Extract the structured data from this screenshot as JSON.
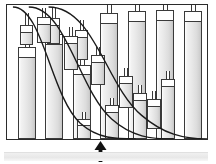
{
  "figure": {
    "frame": {
      "x": 6,
      "y": 4,
      "width": 202,
      "height": 136,
      "border_color": "#2b2b2b"
    },
    "colors": {
      "outline": "#3a3a3a",
      "frame_border": "#2b2b2b",
      "curve": "#1a1a1a",
      "arrow": "#111111",
      "cylinder_light": "#ffffff",
      "cylinder_dark": "#c4c4c4",
      "cap_fill": "#ffffff",
      "bottom_band": "#ececec"
    },
    "cylinders": [
      {
        "name": "cyl-r1c1",
        "x": 11,
        "y": 42,
        "w": 18,
        "h": 92,
        "cap_h": 11,
        "stem_h": 20,
        "stem_w": 5
      },
      {
        "name": "cyl-r1c2",
        "x": 38,
        "y": 29,
        "w": 18,
        "h": 105,
        "cap_h": 11,
        "stem_h": 16,
        "stem_w": 5
      },
      {
        "name": "cyl-r1c3",
        "x": 66,
        "y": 60,
        "w": 18,
        "h": 74,
        "cap_h": 10,
        "stem_h": 14,
        "stem_w": 5
      },
      {
        "name": "cyl-r1c4",
        "x": 93,
        "y": 8,
        "w": 18,
        "h": 126,
        "cap_h": 11,
        "stem_h": 8,
        "stem_w": 5
      },
      {
        "name": "cyl-r1c5",
        "x": 121,
        "y": 6,
        "w": 18,
        "h": 128,
        "cap_h": 11,
        "stem_h": 6,
        "stem_w": 5
      },
      {
        "name": "cyl-r1c6",
        "x": 149,
        "y": 5,
        "w": 18,
        "h": 129,
        "cap_h": 11,
        "stem_h": 5,
        "stem_w": 5
      },
      {
        "name": "cyl-r1c7",
        "x": 177,
        "y": 6,
        "w": 18,
        "h": 128,
        "cap_h": 11,
        "stem_h": 6,
        "stem_w": 5
      },
      {
        "name": "cyl-r2c1",
        "x": 13,
        "y": 20,
        "w": 13,
        "h": 20,
        "cap_h": 8,
        "stem_h": 12,
        "stem_w": 4
      },
      {
        "name": "cyl-r2c2",
        "x": 40,
        "y": 13,
        "w": 13,
        "h": 26,
        "cap_h": 8,
        "stem_h": 10,
        "stem_w": 4
      },
      {
        "name": "cyl-r2c3",
        "x": 68,
        "y": 25,
        "w": 13,
        "h": 30,
        "cap_h": 8,
        "stem_h": 10,
        "stem_w": 4
      },
      {
        "name": "cyl-small-a",
        "x": 30,
        "y": 12,
        "w": 14,
        "h": 26,
        "cap_h": 8,
        "stem_h": 9,
        "stem_w": 4
      },
      {
        "name": "cyl-mid-a",
        "x": 57,
        "y": 31,
        "w": 14,
        "h": 34,
        "cap_h": 8,
        "stem_h": 9,
        "stem_w": 4
      },
      {
        "name": "cyl-mid-b",
        "x": 84,
        "y": 50,
        "w": 14,
        "h": 30,
        "cap_h": 8,
        "stem_h": 8,
        "stem_w": 4
      },
      {
        "name": "cyl-mid-c",
        "x": 112,
        "y": 71,
        "w": 14,
        "h": 32,
        "cap_h": 8,
        "stem_h": 8,
        "stem_w": 4
      },
      {
        "name": "cyl-mid-d",
        "x": 140,
        "y": 94,
        "w": 14,
        "h": 30,
        "cap_h": 8,
        "stem_h": 8,
        "stem_w": 4
      },
      {
        "name": "cyl-low-a",
        "x": 70,
        "y": 114,
        "w": 14,
        "h": 20,
        "cap_h": 7,
        "stem_h": 7,
        "stem_w": 4
      },
      {
        "name": "cyl-low-b",
        "x": 98,
        "y": 100,
        "w": 14,
        "h": 34,
        "cap_h": 8,
        "stem_h": 7,
        "stem_w": 4
      },
      {
        "name": "cyl-low-c",
        "x": 126,
        "y": 88,
        "w": 14,
        "h": 46,
        "cap_h": 8,
        "stem_h": 8,
        "stem_w": 4
      },
      {
        "name": "cyl-low-d",
        "x": 154,
        "y": 74,
        "w": 14,
        "h": 60,
        "cap_h": 8,
        "stem_h": 8,
        "stem_w": 4
      }
    ],
    "curves": [
      {
        "name": "sigmoid-curve-1",
        "path": "M 6 2 C 36 2 44 92 74 120 C 92 136 110 136 130 136"
      },
      {
        "name": "sigmoid-curve-2",
        "path": "M 22 2 C 60 2 72 86 106 116 C 126 134 146 136 168 136"
      },
      {
        "name": "sigmoid-curve-3",
        "path": "M 42 2 C 88 2 100 82 136 112 C 158 131 178 136 202 136"
      }
    ],
    "arrow": {
      "name": "up-arrow-indicator",
      "x": 94,
      "y": 141,
      "width": 13,
      "height": 21,
      "points_to": "cyl-low-a"
    },
    "bottom_band": {
      "name": "bottom-band",
      "visible": true
    }
  }
}
